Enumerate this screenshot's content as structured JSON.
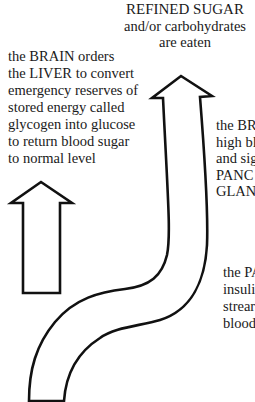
{
  "diagram": {
    "colors": {
      "background": "#ffffff",
      "stroke": "#111111",
      "text": "#1a1a1a"
    },
    "top_label": {
      "lines": [
        "REFINED SUGAR",
        "and/or carbohydrates",
        "are eaten"
      ]
    },
    "left_label": {
      "lines": [
        "the BRAIN orders",
        "the LIVER to convert",
        "emergency reserves of",
        "stored energy called",
        "glycogen into glucose",
        "to return blood sugar",
        "to normal level"
      ]
    },
    "right_label_1": {
      "lines": [
        "the BR",
        "high bl",
        "and sig",
        "PANC",
        "GLAN"
      ]
    },
    "right_label_2": {
      "lines": [
        "the PA",
        "insuli",
        "strear",
        "blood"
      ]
    },
    "arrows": [
      {
        "name": "liver-response-arrow",
        "direction": "up",
        "shape": "straight"
      },
      {
        "name": "sugar-intake-arrow",
        "direction": "up",
        "shape": "s-curve"
      }
    ]
  }
}
